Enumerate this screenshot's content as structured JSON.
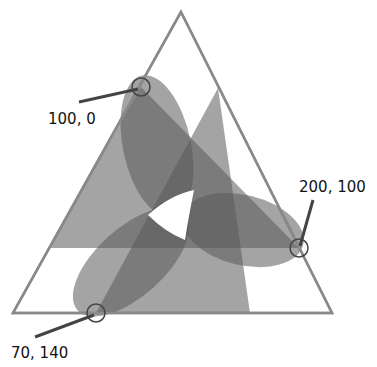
{
  "diagram": {
    "outer_triangle": {
      "stroke": "#8a8a8a"
    },
    "fill_color": "#5a5a5a",
    "fill_opacity": 0.55,
    "points": [
      {
        "id": "p1",
        "label": "100, 0"
      },
      {
        "id": "p2",
        "label": "200, 100"
      },
      {
        "id": "p3",
        "label": "70, 140"
      }
    ]
  }
}
